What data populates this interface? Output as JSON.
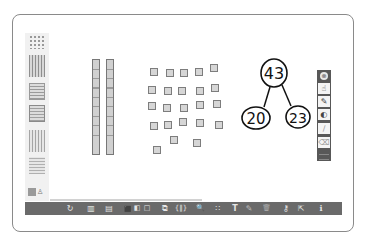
{
  "workspace": {
    "title": "Base Ten Blocks",
    "palette": {
      "items": [
        {
          "name": "units",
          "icon": "unit-cubes-icon"
        },
        {
          "name": "rods",
          "icon": "ten-rods-icon"
        },
        {
          "name": "flats",
          "icon": "hundred-flat-icon"
        },
        {
          "name": "cube",
          "icon": "thousand-cube-icon"
        },
        {
          "name": "rods-outline",
          "icon": "rods-outline-icon"
        },
        {
          "name": "flat-outline",
          "icon": "flat-outline-icon"
        }
      ],
      "bottom_icon": "settings-icon"
    },
    "canvas": {
      "tens_rods": 2,
      "unit_cubes": 23,
      "number_bond": {
        "whole": "43",
        "parts": [
          "20",
          "23"
        ]
      }
    },
    "drawing_tools": {
      "close": "⊗",
      "items": [
        {
          "name": "select",
          "glyph": "☝"
        },
        {
          "name": "pen",
          "glyph": "✎"
        },
        {
          "name": "color",
          "glyph": "◐"
        },
        {
          "name": "highlighter",
          "glyph": "∕"
        },
        {
          "name": "eraser",
          "glyph": "⌫"
        }
      ]
    },
    "toolbar": {
      "items": [
        {
          "name": "reset",
          "glyph": "↻",
          "x": 44
        },
        {
          "name": "group",
          "glyph": "▥",
          "x": 65
        },
        {
          "name": "ungroup",
          "glyph": "▤",
          "x": 83
        },
        {
          "name": "fill-dark",
          "glyph": "⬛",
          "x": 102
        },
        {
          "name": "fill-medium",
          "glyph": "◧",
          "x": 112
        },
        {
          "name": "fill-none",
          "glyph": "□",
          "x": 122
        },
        {
          "name": "duplicate",
          "glyph": "⧉",
          "x": 140
        },
        {
          "name": "brackets",
          "glyph": "{‖}",
          "x": 156
        },
        {
          "name": "zoom",
          "glyph": "🔍",
          "x": 175
        },
        {
          "name": "align",
          "glyph": "∷",
          "x": 193
        },
        {
          "name": "text",
          "glyph": "T",
          "x": 210
        },
        {
          "name": "draw",
          "glyph": "✎",
          "x": 224
        },
        {
          "name": "trash",
          "glyph": "🗑",
          "x": 241
        },
        {
          "name": "key",
          "glyph": "⚷",
          "x": 261
        },
        {
          "name": "share",
          "glyph": "⇱",
          "x": 276
        },
        {
          "name": "info",
          "glyph": "ℹ",
          "x": 296
        }
      ]
    }
  }
}
